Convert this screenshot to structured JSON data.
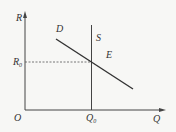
{
  "diagram": {
    "type": "supply-demand",
    "colors": {
      "background": "#f7f7f5",
      "ink": "#333333"
    },
    "axes": {
      "y_label": "R",
      "x_label": "Q",
      "origin_label": "O"
    },
    "curves": {
      "demand_label": "D",
      "supply_label": "S"
    },
    "equilibrium": {
      "point_label": "E",
      "price_label_main": "R",
      "price_label_sub": "0",
      "quantity_label_main": "Q",
      "quantity_label_sub": "0"
    }
  }
}
